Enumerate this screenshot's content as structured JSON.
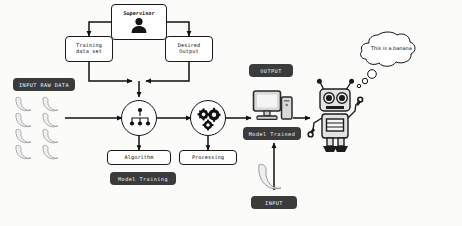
{
  "diagram": {
    "background_color": "#fbfbfa",
    "accent_dark": "#3b3b3b",
    "line_color": "#111111"
  },
  "nodes": {
    "supervisor": {
      "label": "Supervisor",
      "icon": "person-icon"
    },
    "training_data": {
      "label": "Training\ndata set"
    },
    "desired_output": {
      "label": "Desired\nOutput"
    },
    "algorithm_circle": {
      "icon": "hierarchy-tree-icon"
    },
    "algorithm": {
      "label": "Algorithm"
    },
    "processing_circle": {
      "icon": "gears-icon"
    },
    "processing": {
      "label": "Processing"
    },
    "monitor": {
      "icon": "desktop-computer-icon"
    },
    "robot": {
      "icon": "robot-icon"
    }
  },
  "tags": {
    "input_raw_data": "INPUT RAW DATA",
    "model_training": "Model Training",
    "output": "OUTPUT",
    "model_trained": "Model Trained",
    "input": "INPUT"
  },
  "thought_bubble": {
    "text": "This is a banana"
  },
  "raw_data": {
    "item_icon": "banana-icon",
    "columns": 2,
    "rows": 4,
    "count": 8
  },
  "input_sample": {
    "item_icon": "banana-icon",
    "count": 1
  }
}
